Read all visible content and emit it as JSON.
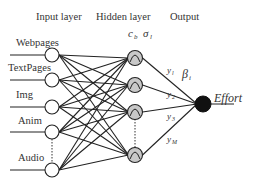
{
  "headers": {
    "input": "Input layer",
    "hidden": "Hidden layer",
    "output": "Output"
  },
  "hidden_params": {
    "center": "c",
    "center_sub": "b",
    "sigma": "σ",
    "sigma_sub": "l"
  },
  "inputs": [
    {
      "label": "Webpages"
    },
    {
      "label": "TextPages"
    },
    {
      "label": "Img"
    },
    {
      "label": "Anim"
    },
    {
      "label": "Audio"
    }
  ],
  "hidden_nodes": [
    {
      "label": "y",
      "sub": "l"
    },
    {
      "label": "y",
      "sub": "2"
    },
    {
      "label": "y",
      "sub": "3"
    },
    {
      "label": "y",
      "sub": "M"
    }
  ],
  "weight_label": {
    "text": "β",
    "sub": "i"
  },
  "output": {
    "label": "Effort"
  },
  "colors": {
    "line": "#222222",
    "hidden_fill": "#c8c8c8",
    "output_fill": "#111111"
  }
}
